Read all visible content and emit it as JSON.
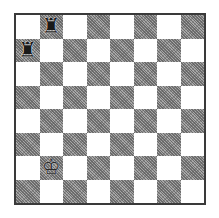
{
  "board": {
    "size": 8,
    "top_left_square_color": "light",
    "colors": {
      "light": "#ffffff",
      "dark": "#8a8a8a",
      "border": "#3a3a3a"
    },
    "ranks_top_to_bottom": [
      "8",
      "7",
      "6",
      "5",
      "4",
      "3",
      "2",
      "1"
    ],
    "files_left_to_right": [
      "a",
      "b",
      "c",
      "d",
      "e",
      "f",
      "g",
      "h"
    ]
  },
  "pieces": [
    {
      "square": "b8",
      "type": "rook",
      "color": "black",
      "glyph": "♜"
    },
    {
      "square": "a7",
      "type": "rook",
      "color": "black",
      "glyph": "♜"
    },
    {
      "square": "b2",
      "type": "king",
      "color": "white",
      "glyph": "♔"
    }
  ]
}
